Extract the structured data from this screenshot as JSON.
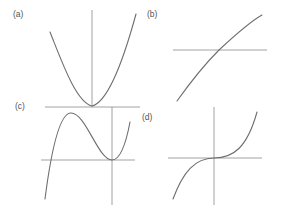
{
  "figure": {
    "panels": [
      {
        "id": "a",
        "label": "(a)",
        "shape": "parabola"
      },
      {
        "id": "b",
        "label": "(b)",
        "shape": "increasing-concave-curve"
      },
      {
        "id": "c",
        "label": "(c)",
        "shape": "cubic-with-local-max-and-min"
      },
      {
        "id": "d",
        "label": "(d)",
        "shape": "cubic-inflection-at-origin"
      }
    ],
    "colors": {
      "curve": "#6e6e6e",
      "axis": "#8a8a8a",
      "label": "#555555",
      "background": "#ffffff"
    }
  }
}
